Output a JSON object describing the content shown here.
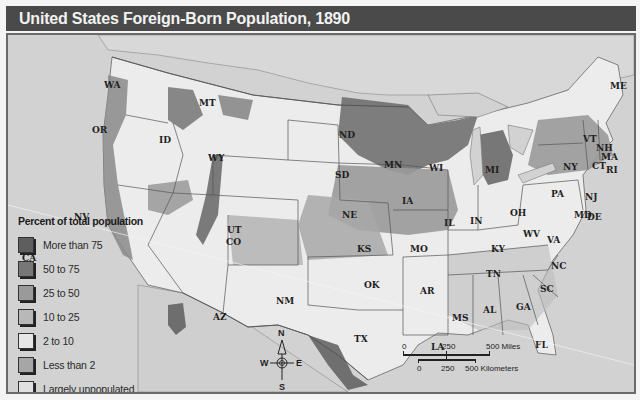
{
  "header": {
    "title": "United States Foreign-Born Population, 1890"
  },
  "legend": {
    "title": "Percent of total population",
    "items": [
      {
        "label": "More than 75",
        "color": "#5e5e5e"
      },
      {
        "label": "50 to 75",
        "color": "#777777"
      },
      {
        "label": "25 to 50",
        "color": "#9a9a9a"
      },
      {
        "label": "10 to 25",
        "color": "#b8b8b8"
      },
      {
        "label": "2 to 10",
        "color": "#e6e6e6"
      },
      {
        "label": "Less than  2",
        "color": "#a6a6a6"
      },
      {
        "label": "Largely unpopulated",
        "color": "#e0e0e0"
      },
      {
        "label": "Present-day borders",
        "color": "#f4f4f4"
      }
    ]
  },
  "states": [
    {
      "abbr": "WA",
      "x": 104,
      "y": 48
    },
    {
      "abbr": "OR",
      "x": 92,
      "y": 93
    },
    {
      "abbr": "CA",
      "x": 22,
      "y": 221
    },
    {
      "abbr": "ID",
      "x": 159,
      "y": 103
    },
    {
      "abbr": "NV",
      "x": 74,
      "y": 180
    },
    {
      "abbr": "MT",
      "x": 199,
      "y": 66
    },
    {
      "abbr": "WY",
      "x": 208,
      "y": 121
    },
    {
      "abbr": "UT",
      "x": 227,
      "y": 193
    },
    {
      "abbr": "CO",
      "x": 226,
      "y": 205
    },
    {
      "abbr": "AZ",
      "x": 213,
      "y": 280
    },
    {
      "abbr": "NM",
      "x": 276,
      "y": 264
    },
    {
      "abbr": "ND",
      "x": 339,
      "y": 98
    },
    {
      "abbr": "SD",
      "x": 335,
      "y": 138
    },
    {
      "abbr": "NE",
      "x": 342,
      "y": 178
    },
    {
      "abbr": "KS",
      "x": 357,
      "y": 212
    },
    {
      "abbr": "OK",
      "x": 364,
      "y": 248
    },
    {
      "abbr": "TX",
      "x": 354,
      "y": 302
    },
    {
      "abbr": "MN",
      "x": 384,
      "y": 128
    },
    {
      "abbr": "IA",
      "x": 402,
      "y": 164
    },
    {
      "abbr": "MO",
      "x": 410,
      "y": 212
    },
    {
      "abbr": "AR",
      "x": 420,
      "y": 254
    },
    {
      "abbr": "LA",
      "x": 431,
      "y": 310
    },
    {
      "abbr": "WI",
      "x": 429,
      "y": 131
    },
    {
      "abbr": "IL",
      "x": 444,
      "y": 186
    },
    {
      "abbr": "MI",
      "x": 485,
      "y": 133
    },
    {
      "abbr": "IN",
      "x": 470,
      "y": 184
    },
    {
      "abbr": "OH",
      "x": 510,
      "y": 176
    },
    {
      "abbr": "KY",
      "x": 491,
      "y": 212
    },
    {
      "abbr": "TN",
      "x": 486,
      "y": 237
    },
    {
      "abbr": "MS",
      "x": 452,
      "y": 281
    },
    {
      "abbr": "AL",
      "x": 483,
      "y": 273
    },
    {
      "abbr": "GA",
      "x": 516,
      "y": 270
    },
    {
      "abbr": "FL",
      "x": 535,
      "y": 308
    },
    {
      "abbr": "SC",
      "x": 540,
      "y": 252
    },
    {
      "abbr": "NC",
      "x": 551,
      "y": 229
    },
    {
      "abbr": "VA",
      "x": 547,
      "y": 203
    },
    {
      "abbr": "WV",
      "x": 523,
      "y": 197
    },
    {
      "abbr": "PA",
      "x": 551,
      "y": 157
    },
    {
      "abbr": "NY",
      "x": 563,
      "y": 130
    },
    {
      "abbr": "NJ",
      "x": 585,
      "y": 160
    },
    {
      "abbr": "MD",
      "x": 574,
      "y": 178
    },
    {
      "abbr": "DE",
      "x": 587,
      "y": 180
    },
    {
      "abbr": "VT",
      "x": 583,
      "y": 102
    },
    {
      "abbr": "NH",
      "x": 596,
      "y": 111
    },
    {
      "abbr": "MA",
      "x": 601,
      "y": 120
    },
    {
      "abbr": "CT",
      "x": 592,
      "y": 129
    },
    {
      "abbr": "RI",
      "x": 606,
      "y": 133
    },
    {
      "abbr": "ME",
      "x": 610,
      "y": 49
    }
  ],
  "scale": {
    "miles_ticks": [
      "0",
      "250",
      "500 Miles"
    ],
    "km_ticks": [
      "0",
      "250",
      "500 Kilometers"
    ]
  },
  "compass": {
    "n": "N",
    "s": "S",
    "e": "E",
    "w": "W"
  },
  "colors": {
    "title_bg": "#4a4a4a",
    "water": "#d2d2d2",
    "land_light": "#ececec"
  }
}
